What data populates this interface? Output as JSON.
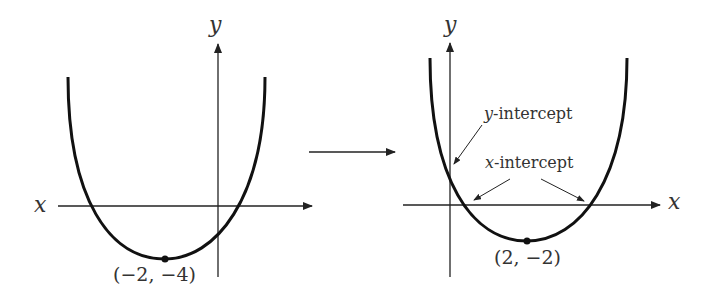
{
  "left_graph": {
    "x_axis_label": "x",
    "y_axis_label": "y",
    "vertex_label": "(−2, −4)",
    "vertex": [
      -2,
      -4
    ]
  },
  "transform_arrow": "right-arrow",
  "right_graph": {
    "x_axis_label": "x",
    "y_axis_label": "y",
    "vertex_label": "(2, −2)",
    "vertex": [
      2,
      -2
    ],
    "y_intercept_var": "y",
    "y_intercept_suffix": "-intercept",
    "x_intercept_var": "x",
    "x_intercept_suffix": "-intercept"
  },
  "colors": {
    "curve": "#111111",
    "axis": "#222222",
    "text": "#333333"
  }
}
